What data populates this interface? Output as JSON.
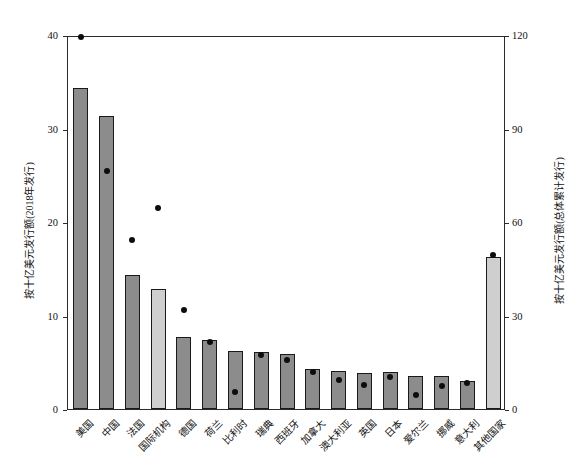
{
  "chart_data": {
    "type": "bar",
    "title": "",
    "xlabel": "",
    "ylabel": "按十亿美元发行额(2018年发行)",
    "ylabel_right": "按十亿美元发行额(总体累计发行)",
    "categories": [
      "美国",
      "中国",
      "法国",
      "国际机构",
      "德国",
      "荷兰",
      "比利时",
      "瑞典",
      "西班牙",
      "加拿大",
      "澳大利亚",
      "英国",
      "日本",
      "爱尔兰",
      "挪威",
      "意大利",
      "其他国家"
    ],
    "series": [
      {
        "name": "按十亿美元发行额(2018年发行)",
        "type": "bar",
        "axis": "left",
        "values": [
          34.3,
          31.3,
          14.3,
          12.8,
          7.7,
          7.4,
          6.2,
          6.1,
          5.9,
          4.3,
          4.1,
          3.8,
          4.0,
          3.5,
          3.5,
          3.0,
          16.3
        ],
        "colors": [
          "dark",
          "dark",
          "dark",
          "light",
          "dark",
          "dark",
          "dark",
          "dark",
          "dark",
          "dark",
          "dark",
          "dark",
          "dark",
          "dark",
          "dark",
          "dark",
          "light"
        ]
      },
      {
        "name": "按十亿美元发行额(总体累计发行)",
        "type": "scatter",
        "axis": "right",
        "values": [
          120,
          77,
          55,
          65,
          32.5,
          22,
          6,
          18,
          16.5,
          12.5,
          10,
          8.5,
          11,
          5,
          8,
          9,
          50
        ]
      }
    ],
    "ylim": [
      0,
      40
    ],
    "ylim_right": [
      0,
      120
    ],
    "yticks": [
      0,
      10,
      20,
      30,
      40
    ],
    "yticks_right": [
      0,
      30,
      60,
      90,
      120
    ],
    "ytick_labels": [
      "0",
      "10",
      "20",
      "30",
      "40"
    ],
    "ytick_labels_right": [
      "0",
      "30",
      "60",
      "90",
      "120"
    ],
    "grid": false,
    "legend": "none",
    "bar_color_dark": "#8c8c8c",
    "bar_color_light": "#cfcfcf",
    "dot_color": "#0d0d0d",
    "axis_color": "#2b2b2b"
  }
}
